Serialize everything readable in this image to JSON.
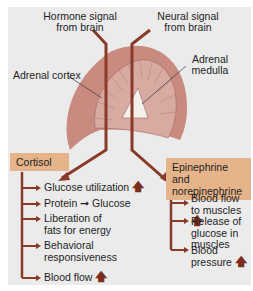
{
  "title_labels": {
    "hormone_signal": [
      "Hormone signal",
      "from brain"
    ],
    "neural_signal": [
      "Neural signal",
      "from brain"
    ],
    "adrenal_cortex": "Adrenal cortex",
    "adrenal_medulla": [
      "Adrenal",
      "medulla"
    ]
  },
  "colors": {
    "arrow": "#8a3a28",
    "gland_outer": "#c98a80",
    "gland_inner": "#d9aaa2",
    "box": "#e6b48a",
    "panel": "#ebebeb"
  },
  "cortisol": {
    "label": "Cortisol",
    "effects": [
      {
        "text": "Glucose utilization",
        "increase": true
      },
      {
        "text": "Protein ➞ Glucose",
        "increase": false
      },
      {
        "text": "Liberation of fats for energy",
        "increase": false
      },
      {
        "text": "Behavioral responsiveness",
        "increase": false
      },
      {
        "text": "Blood flow",
        "increase": true
      }
    ]
  },
  "catecholamines": {
    "label": "Epinephrine and norepinephrine",
    "effects": [
      {
        "text": "Blood flow to muscles",
        "increase": true
      },
      {
        "text": "Release of glucose in muscles",
        "increase": false
      },
      {
        "text": "Blood pressure",
        "increase": true
      }
    ]
  },
  "icons": {
    "increase": "up-arrow-icon",
    "leads_to": "right-arrow-icon"
  }
}
